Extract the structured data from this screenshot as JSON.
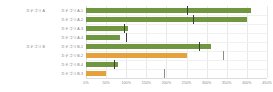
{
  "chart_data": {
    "type": "bar",
    "orientation": "horizontal",
    "title": "",
    "subtitle": "",
    "xlabel": "",
    "ylabel": "",
    "xlim": [
      0,
      450
    ],
    "grid": true,
    "legend_position": "none",
    "tick_labels": [
      "0%",
      "50%",
      "100%",
      "150%",
      "200%",
      "250%",
      "300%",
      "350%",
      "400%",
      "450%"
    ],
    "tick_values": [
      0,
      50,
      100,
      150,
      200,
      250,
      300,
      350,
      400,
      450
    ],
    "group_labels": [
      "カテゴリA",
      "カテゴリB"
    ],
    "colors": {
      "green": "#70973F",
      "orange": "#E4A13C",
      "marker": "#3c3c3c",
      "marker_muted": "#8c8c8c",
      "grid": "#e9e9e9",
      "axis": "#dddddd",
      "text": "#7a7a7a"
    },
    "categories": [
      "カテゴリA-1",
      "カテゴリA-2",
      "カテゴリA-3",
      "カテゴリA-4",
      "カテゴリB-1",
      "カテゴリB-2",
      "カテゴリB-4",
      "カテゴリB-3"
    ],
    "values": [
      410,
      400,
      105,
      85,
      310,
      250,
      80,
      50
    ],
    "targets": [
      250,
      265,
      95,
      100,
      280,
      340,
      70,
      195
    ],
    "bar_colors": [
      "green",
      "green",
      "green",
      "green",
      "green",
      "orange",
      "green",
      "orange"
    ],
    "marker_styles": [
      "dark",
      "dark",
      "dark",
      "dark",
      "dark",
      "muted",
      "dark",
      "muted"
    ],
    "series": [
      {
        "name": "実績",
        "values": [
          410,
          400,
          105,
          85,
          310,
          250,
          80,
          50
        ]
      },
      {
        "name": "目標",
        "values": [
          250,
          265,
          95,
          100,
          280,
          340,
          70,
          195
        ]
      }
    ],
    "rows": [
      {
        "group": "カテゴリA",
        "label": "カテゴリA-1",
        "value": 410,
        "target": 250,
        "color": "green",
        "marker": "dark"
      },
      {
        "group": "カテゴリA",
        "label": "カテゴリA-2",
        "value": 400,
        "target": 265,
        "color": "green",
        "marker": "dark"
      },
      {
        "group": "カテゴリA",
        "label": "カテゴリA-3",
        "value": 105,
        "target": 95,
        "color": "green",
        "marker": "dark"
      },
      {
        "group": "カテゴリA",
        "label": "カテゴリA-4",
        "value": 85,
        "target": 100,
        "color": "green",
        "marker": "dark"
      },
      {
        "group": "カテゴリB",
        "label": "カテゴリB-1",
        "value": 310,
        "target": 280,
        "color": "green",
        "marker": "dark"
      },
      {
        "group": "カテゴリB",
        "label": "カテゴリB-2",
        "value": 250,
        "target": 340,
        "color": "orange",
        "marker": "muted"
      },
      {
        "group": "カテゴリB",
        "label": "カテゴリB-4",
        "value": 80,
        "target": 70,
        "color": "green",
        "marker": "dark"
      },
      {
        "group": "カテゴリB",
        "label": "カテゴリB-3",
        "value": 50,
        "target": 195,
        "color": "orange",
        "marker": "muted"
      }
    ]
  }
}
